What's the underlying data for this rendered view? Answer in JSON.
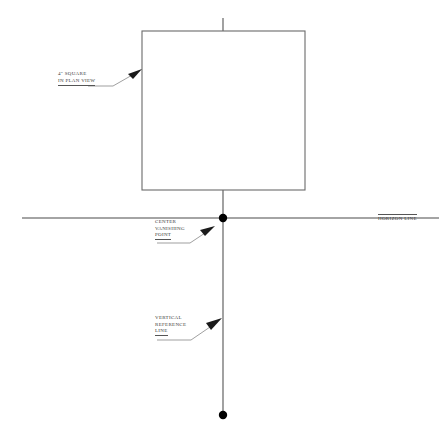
{
  "diagram": {
    "background_color": "#ffffff",
    "line_color": "#4a4a4a",
    "text_color": "#3a3a3a",
    "labels": {
      "plan_square": {
        "line1": "4\" SQUARE",
        "line2": "IN PLAN VIEW"
      },
      "vanishing_point": {
        "line1": "CENTER",
        "line2": "VANISHING",
        "line3": "POINT"
      },
      "vertical_reference": {
        "line1": "VERTICAL",
        "line2": "REFERENCE",
        "line3": "LINE"
      },
      "horizon": {
        "line1": "HORIZON LINE"
      }
    },
    "geometry": {
      "square": {
        "x": 142,
        "y": 31,
        "width": 163,
        "height": 159
      },
      "horizon_line": {
        "x1": 22,
        "y1": 218,
        "x2": 439,
        "y2": 218
      },
      "vertical_line": {
        "x1": 223,
        "y1": 18,
        "x2": 223,
        "y2": 415
      },
      "vanishing_point_dot": {
        "cx": 223,
        "cy": 218,
        "r": 4
      },
      "bottom_endpoint_dot": {
        "cx": 223,
        "cy": 415,
        "r": 4
      }
    }
  }
}
